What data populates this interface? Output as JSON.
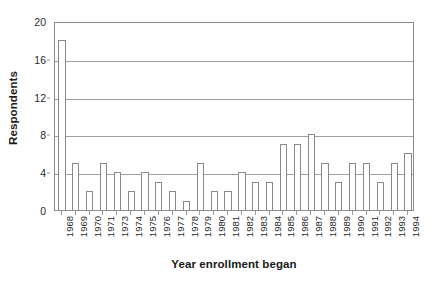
{
  "chart_data": {
    "type": "bar",
    "title": "",
    "subtitle": "",
    "xlabel": "Year enrollment began",
    "ylabel": "Respondents",
    "categories": [
      "1968",
      "1969",
      "1970",
      "1971",
      "1973",
      "1974",
      "1975",
      "1976",
      "1977",
      "1978",
      "1979",
      "1980",
      "1981",
      "1982",
      "1983",
      "1984",
      "1985",
      "1986",
      "1987",
      "1988",
      "1989",
      "1990",
      "1991",
      "1992",
      "1993",
      "1994"
    ],
    "values": [
      18,
      5,
      2,
      5,
      4,
      2,
      4,
      3,
      2,
      1,
      5,
      2,
      2,
      4,
      3,
      3,
      7,
      7,
      8,
      5,
      3,
      5,
      5,
      3,
      5,
      6
    ],
    "series": [
      {
        "name": "Respondents",
        "values": [
          18,
          5,
          2,
          5,
          4,
          2,
          4,
          3,
          2,
          1,
          5,
          2,
          2,
          4,
          3,
          3,
          7,
          7,
          8,
          5,
          3,
          5,
          5,
          3,
          5,
          6
        ]
      }
    ],
    "ylim": [
      0,
      20
    ],
    "ytick_values": [
      0,
      4,
      8,
      12,
      16,
      20
    ],
    "ytick_labels": [
      "0",
      "4",
      "8",
      "12",
      "16",
      "20"
    ],
    "grid": true,
    "grid_axis": "y",
    "legend": false,
    "legend_position": "none",
    "bar_fill_color": "#ffffff",
    "bar_edge_color": "#8a8a8a",
    "gridline_color": "#9e9e9e",
    "axis_color": "#8c8c8c",
    "text_color": "#2b2b2b",
    "background_color": "#ffffff"
  }
}
